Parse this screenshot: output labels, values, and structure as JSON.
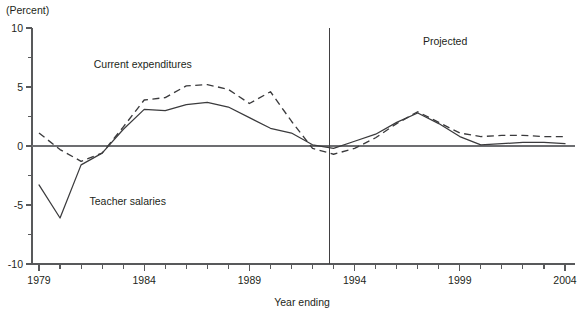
{
  "chart_data": {
    "type": "line",
    "title": "",
    "subtitle": "",
    "xlabel": "Year ending",
    "ylabel": "",
    "yunit": "(Percent)",
    "xlim": [
      1979,
      2004
    ],
    "ylim": [
      -10,
      10
    ],
    "ytick_labels": [
      "10",
      "5",
      "0",
      "-5",
      "-10"
    ],
    "ytick_values": [
      10,
      5,
      0,
      -5,
      -10
    ],
    "yminor_values": [
      7.5,
      2.5,
      -2.5,
      -7.5
    ],
    "xtick_labels": [
      "1979",
      "1984",
      "1989",
      "1994",
      "1999",
      "2004"
    ],
    "xtick_values": [
      1979,
      1984,
      1989,
      1994,
      1999,
      2004
    ],
    "xminor_step": 1,
    "grid": false,
    "legend_position": "inline-labels",
    "x": [
      1979,
      1980,
      1981,
      1982,
      1983,
      1984,
      1985,
      1986,
      1987,
      1988,
      1989,
      1990,
      1991,
      1992,
      1993,
      1994,
      1995,
      1996,
      1997,
      1998,
      1999,
      2000,
      2001,
      2002,
      2003,
      2004
    ],
    "series": [
      {
        "name": "Current expenditures",
        "style": "dashed",
        "label": "Current expenditures",
        "label_x": 1981.6,
        "label_y": 6.6,
        "values": [
          1.1,
          -0.3,
          -1.3,
          -0.6,
          1.6,
          3.9,
          4.1,
          5.1,
          5.2,
          4.8,
          3.6,
          4.6,
          2.1,
          -0.2,
          -0.7,
          -0.2,
          0.7,
          1.9,
          2.9,
          2.0,
          1.1,
          0.8,
          0.9,
          0.9,
          0.8,
          0.8
        ]
      },
      {
        "name": "Teacher salaries",
        "style": "solid",
        "label": "Teacher salaries",
        "label_x": 1981.4,
        "label_y": -5.0,
        "values": [
          -3.3,
          -6.1,
          -1.6,
          -0.6,
          1.4,
          3.1,
          3.0,
          3.5,
          3.7,
          3.3,
          2.4,
          1.5,
          1.1,
          0.1,
          -0.2,
          0.4,
          1.0,
          2.0,
          2.8,
          1.9,
          0.8,
          0.1,
          0.2,
          0.3,
          0.3,
          0.2
        ]
      }
    ],
    "annotations": [
      {
        "name": "projected-label",
        "text": "Projected",
        "x": 1998.3,
        "y": 8.6
      }
    ],
    "divider": {
      "name": "projection-divider",
      "x": 1992.8,
      "y_top": 10,
      "y_bottom": -10
    }
  }
}
